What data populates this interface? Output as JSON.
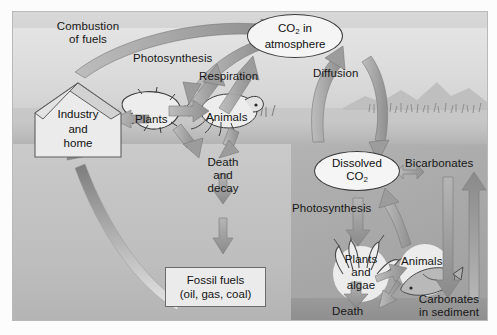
{
  "diagram": {
    "nodes": {
      "combustion": "Combustion\nof fuels",
      "photosynthesis_land": "Photosynthesis",
      "respiration": "Respiration",
      "diffusion": "Diffusion",
      "co2_atmosphere": "CO2 in\natmosphere",
      "industry_home": "Industry\nand\nhome",
      "plants_land": "Plants",
      "animals_land": "Animals",
      "death_decay": "Death\nand\ndecay",
      "fossil_fuels": "Fossil fuels\n(oil, gas, coal)",
      "dissolved_co2": "Dissolved\nCO2",
      "bicarbonates": "Bicarbonates",
      "photosynthesis_water": "Photosynthesis",
      "plants_algae": "Plants\nand\nalgae",
      "animals_water": "Animals",
      "death_water": "Death",
      "carbonates_sediment": "Carbonates\nin sediment"
    },
    "co2_atmosphere_parts": {
      "pre": "CO",
      "sub": "2",
      "post": " in",
      "line2": "atmosphere"
    },
    "dissolved_co2_parts": {
      "line1": "Dissolved",
      "pre": "CO",
      "sub": "2"
    },
    "colors": {
      "arrow_fill": "#9a9a9a",
      "arrow_stroke": "#6f6f6f",
      "box_fill": "#ebebeb",
      "box_border": "#6c6c6c",
      "ellipse_fill": "#f5f5f5",
      "ellipse_border": "#3a3a3a",
      "sky": "#d4d4d4",
      "sea": "#b6b6b6",
      "ground": "#c4c4c4",
      "basin": "#aaaaaa",
      "text": "#141414"
    },
    "icons": [
      "house-icon",
      "leaf-icon",
      "rodent-icon",
      "coral-algae-icon",
      "fish-icon",
      "grass-icon",
      "hills-icon"
    ]
  }
}
